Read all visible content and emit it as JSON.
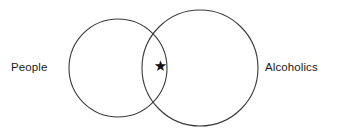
{
  "diagram": {
    "type": "venn",
    "title": "",
    "background_color": "#ffffff",
    "stroke_color": "#3a3a3a",
    "text_color": "#1b1b1b",
    "sets": [
      {
        "id": "people",
        "label": "People",
        "label_position": "outside-left",
        "circle": {
          "cx": 118,
          "cy": 68,
          "r": 49
        }
      },
      {
        "id": "alcoholics",
        "label": "Alcoholics",
        "label_position": "outside-right",
        "circle": {
          "cx": 200,
          "cy": 68,
          "r": 58
        }
      }
    ],
    "markers": [
      {
        "id": "intersection-star",
        "glyph": "★",
        "symbol_name": "asterisk-star",
        "region": "intersection",
        "x": 160,
        "y": 67
      }
    ]
  }
}
